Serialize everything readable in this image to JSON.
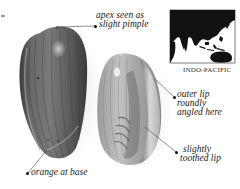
{
  "figure": {
    "type": "shell-identification-plate",
    "colors": {
      "background": "#ffffff",
      "text": "#1c1c1c",
      "left_shell_body": "#5a5a5a",
      "right_shell_body": "#b8b8b8",
      "map_land": "#111111",
      "map_sea": "#ffffff"
    }
  },
  "annotations": {
    "apex": {
      "lines": [
        "apex seen as",
        "slight pimple"
      ]
    },
    "outer_lip": {
      "lines": [
        "outer lip",
        "roundly",
        "angled here"
      ]
    },
    "toothed_lip": {
      "lines": [
        "slightly",
        "toothed lip"
      ]
    },
    "base": {
      "lines": [
        "orange at base"
      ]
    }
  },
  "map": {
    "region_label": "INDO-PACIFIC"
  }
}
